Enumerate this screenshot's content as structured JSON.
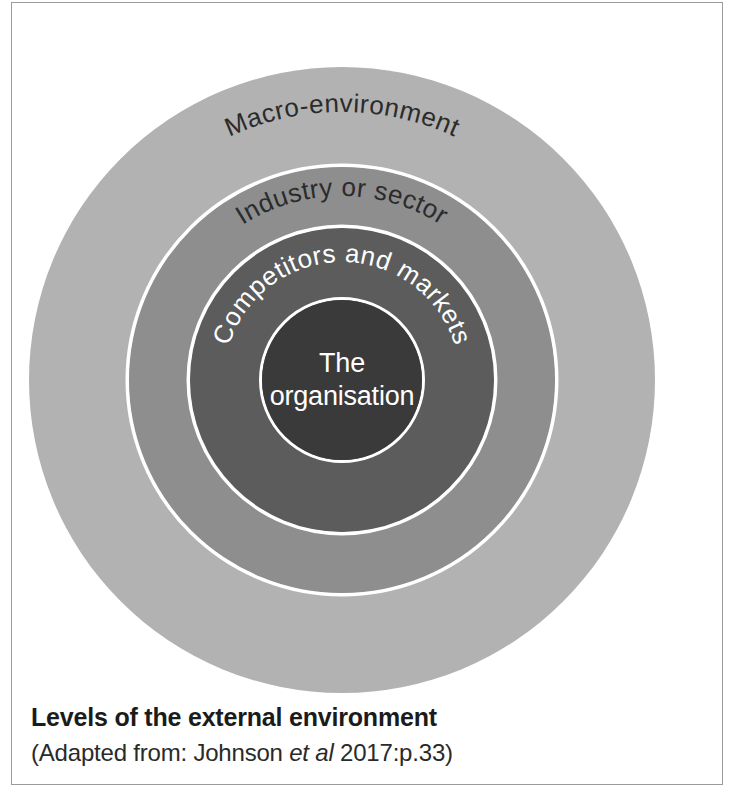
{
  "figure": {
    "caption_title": "Levels of the external environment",
    "caption_source_prefix": "(Adapted from: Johnson ",
    "caption_source_italic": "et al",
    "caption_source_suffix": " 2017:p.33)"
  },
  "diagram": {
    "type": "concentric-circles",
    "center": {
      "x": 330,
      "y": 377
    },
    "layers": [
      {
        "id": "macro-environment",
        "label": "Macro-environment",
        "radius": 313,
        "fill": "#b2b2b2",
        "text_color": "#2b2b2b",
        "text_placement": "arc-top",
        "font_size": 26
      },
      {
        "id": "industry-or-sector",
        "label": "Industry or sector",
        "radius": 213,
        "fill": "#8e8e8e",
        "text_color": "#2b2b2b",
        "text_placement": "arc-top",
        "font_size": 26
      },
      {
        "id": "competitors-and-markets",
        "label": "Competitors and markets",
        "radius": 152,
        "fill": "#5c5c5c",
        "text_color": "#ffffff",
        "text_placement": "arc-top",
        "font_size": 26
      },
      {
        "id": "the-organisation",
        "label_line1": "The",
        "label_line2": "organisation",
        "radius": 80,
        "fill": "#3a3a3a",
        "text_color": "#ffffff",
        "text_placement": "center",
        "font_size": 27
      }
    ],
    "separator_ring_color": "#ffffff",
    "separator_ring_width": 3,
    "background": "#ffffff"
  },
  "frame": {
    "border_color": "#9b9b9b"
  }
}
